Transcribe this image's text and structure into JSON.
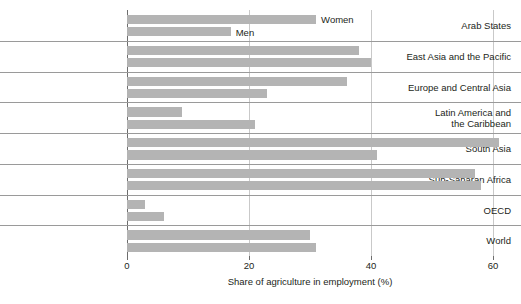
{
  "chart_data": {
    "type": "bar",
    "orientation": "horizontal",
    "title": "",
    "xlabel": "Share of agriculture in employment (%)",
    "ylabel": "",
    "xlim": [
      0,
      60
    ],
    "xticks": [
      0,
      20,
      40,
      60
    ],
    "xtick_labels": [
      "0",
      "20",
      "40",
      "60"
    ],
    "grid": true,
    "legend_position": "inline-first-row",
    "categories": [
      "Arab States",
      "East Asia and the Pacific",
      "Europe and Central Asia",
      "Latin America and\nthe Caribbean",
      "South Asia",
      "Sub-Saharan Africa",
      "OECD",
      "World"
    ],
    "series": [
      {
        "name": "Women",
        "values": [
          31,
          38,
          36,
          9,
          61,
          57,
          3,
          30
        ]
      },
      {
        "name": "Men",
        "values": [
          17,
          40,
          23,
          21,
          41,
          58,
          6,
          31
        ]
      }
    ],
    "bar_color": "#b4b4b4",
    "gridline_color": "#c9c9c9",
    "axis_color": "#6d6d6d"
  },
  "rows": [
    {
      "label_lines": [
        "Arab States"
      ],
      "bars": [
        {
          "series": "Women",
          "value": 31,
          "tag": "Women"
        },
        {
          "series": "Men",
          "value": 17,
          "tag": "Men"
        }
      ]
    },
    {
      "label_lines": [
        "East Asia and the Pacific"
      ],
      "bars": [
        {
          "series": "Women",
          "value": 38,
          "tag": ""
        },
        {
          "series": "Men",
          "value": 40,
          "tag": ""
        }
      ]
    },
    {
      "label_lines": [
        "Europe and Central Asia"
      ],
      "bars": [
        {
          "series": "Women",
          "value": 36,
          "tag": ""
        },
        {
          "series": "Men",
          "value": 23,
          "tag": ""
        }
      ]
    },
    {
      "label_lines": [
        "Latin America and",
        "the Caribbean"
      ],
      "bars": [
        {
          "series": "Women",
          "value": 9,
          "tag": ""
        },
        {
          "series": "Men",
          "value": 21,
          "tag": ""
        }
      ]
    },
    {
      "label_lines": [
        "South Asia"
      ],
      "bars": [
        {
          "series": "Women",
          "value": 61,
          "tag": ""
        },
        {
          "series": "Men",
          "value": 41,
          "tag": ""
        }
      ]
    },
    {
      "label_lines": [
        "Sub-Saharan Africa"
      ],
      "bars": [
        {
          "series": "Women",
          "value": 57,
          "tag": ""
        },
        {
          "series": "Men",
          "value": 58,
          "tag": ""
        }
      ]
    },
    {
      "label_lines": [
        "OECD"
      ],
      "bars": [
        {
          "series": "Women",
          "value": 3,
          "tag": ""
        },
        {
          "series": "Men",
          "value": 6,
          "tag": ""
        }
      ]
    },
    {
      "label_lines": [
        "World"
      ],
      "bars": [
        {
          "series": "Women",
          "value": 30,
          "tag": ""
        },
        {
          "series": "Men",
          "value": 31,
          "tag": ""
        }
      ]
    }
  ],
  "axis": {
    "ticks": [
      {
        "value": 0,
        "label": "0"
      },
      {
        "value": 20,
        "label": "20"
      },
      {
        "value": 40,
        "label": "40"
      },
      {
        "value": 60,
        "label": "60"
      }
    ],
    "title": "Share of agriculture in employment (%)"
  }
}
